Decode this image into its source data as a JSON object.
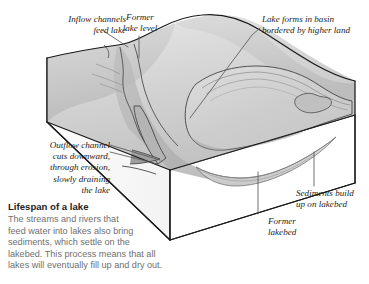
{
  "figure": {
    "type": "block-diagram",
    "background_color": "#ffffff"
  },
  "annotations": {
    "inflow": "Inflow channels\nfeed lake",
    "former_lake_level": "Former\nlake level",
    "lake_basin": "Lake forms in basin\nbordered by higher land",
    "outflow": "Outflow channel\ncuts downward,\nthrough erosion,\nslowly draining\nthe lake",
    "sediments": "Sediments build\nup on lakebed",
    "former_lakebed": "Former\nlakebed"
  },
  "caption": {
    "title": "Lifespan of a lake",
    "body": "The streams and rivers that\nfeed water into lakes also bring\nsediments, which settle on the\nlakebed. This process means that all\nlakes will eventually fill up and dry out."
  },
  "colors": {
    "outline": "#1a1a1a",
    "label_text": "#1d1d1d",
    "caption_title": "#232323",
    "caption_body": "#6f6f70",
    "leader_line": "#585858",
    "terrain_light": "#e3e3e3",
    "terrain_mid": "#cfcfcf",
    "terrain_dark": "#b6b6b6",
    "terrain_shadow": "#9d9d9d",
    "cut_face": "#ffffff",
    "sediment": "#d6d6d6"
  }
}
